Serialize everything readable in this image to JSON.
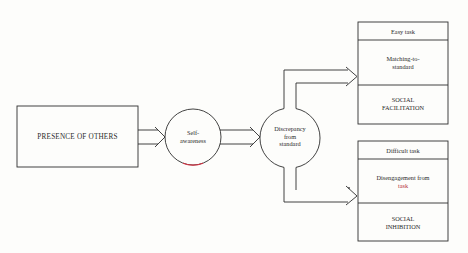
{
  "diagram": {
    "type": "flowchart",
    "nodes": {
      "presence": {
        "label": "PRESENCE OF OTHERS"
      },
      "self_awareness": {
        "label_line1": "Self-",
        "label_line2": "awareness"
      },
      "discrepancy": {
        "label_line1": "Discrepancy",
        "label_line2": "from",
        "label_line3": "standard"
      },
      "easy": {
        "header": "Easy task",
        "process_line1": "Matching-to-",
        "process_line2": "standard",
        "outcome_line1": "SOCIAL",
        "outcome_line2": "FACILITATION"
      },
      "difficult": {
        "header": "Difficult task",
        "process_line1": "Disengagement from",
        "process_line2": "task",
        "outcome_line1": "SOCIAL",
        "outcome_line2": "INHIBITION"
      }
    },
    "edges": [
      {
        "from": "PRESENCE OF OTHERS",
        "to": "Self-awareness"
      },
      {
        "from": "Self-awareness",
        "to": "Discrepancy from standard"
      },
      {
        "from": "Discrepancy from standard",
        "to": "Easy task"
      },
      {
        "from": "Discrepancy from standard",
        "to": "Difficult task"
      }
    ],
    "colors": {
      "line": "#2e2e2e",
      "background": "#fdfdfb",
      "accent": "#b32d3a"
    }
  }
}
